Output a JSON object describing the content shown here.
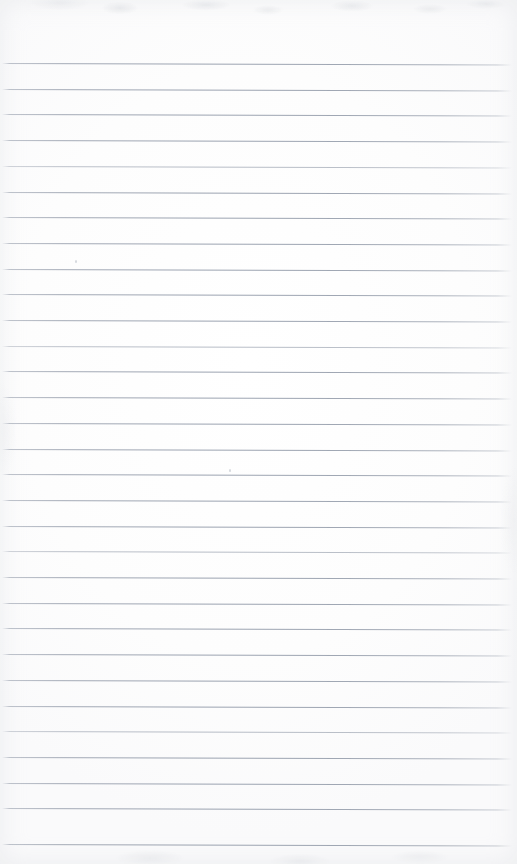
{
  "document": {
    "type": "scanned-lined-paper",
    "title": "Blank lined notepad page",
    "page_width": 517,
    "page_height": 864,
    "text_content": "",
    "has_handwriting": false,
    "has_printed_text": false
  },
  "paper": {
    "background_color": "#fefefe",
    "tone_color": "#fafafb",
    "edge_shadow_color": "#cdd1d7"
  },
  "ruling": {
    "line_color": "#8e97a3",
    "line_count": 31,
    "first_line_y": 63,
    "line_spacing": 25.7,
    "line_left_x": 2,
    "line_right_x": 512,
    "line_thickness": 1,
    "tilt_degrees": 0.17,
    "top_margin": 63,
    "bottom_margin": 20,
    "lines_y": [
      63,
      88.7,
      114.4,
      140.1,
      165.8,
      191.5,
      217.2,
      242.9,
      268.6,
      294.3,
      320.0,
      345.7,
      371.4,
      397.1,
      422.8,
      448.5,
      474.2,
      499.9,
      525.6,
      551.3,
      577.0,
      602.7,
      628.4,
      654.1,
      679.8,
      705.5,
      731.2,
      756.9,
      782.6,
      808.3,
      844.0
    ],
    "faint_line_indices": [
      4,
      11,
      19,
      26
    ]
  },
  "artifacts": {
    "specks": [
      {
        "x": 75,
        "y": 260
      },
      {
        "x": 229,
        "y": 469
      }
    ]
  }
}
